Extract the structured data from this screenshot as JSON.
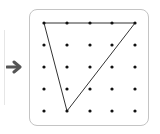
{
  "diagram": {
    "type": "geoboard-dot-grid",
    "arrow": {
      "icon": "arrow-right-icon",
      "color": "#555555"
    },
    "board": {
      "border_color": "#c4c4c4",
      "background": "#ffffff"
    },
    "grid": {
      "rows": 5,
      "cols": 5,
      "x": [
        44,
        67,
        90,
        112,
        135
      ],
      "y": [
        23,
        45,
        67,
        89,
        111
      ],
      "dot_color": "#111111"
    },
    "shape": {
      "type": "triangle",
      "vertices_grid": [
        [
          0,
          0
        ],
        [
          4,
          0
        ],
        [
          1,
          4
        ]
      ],
      "line_color": "#333333"
    }
  }
}
